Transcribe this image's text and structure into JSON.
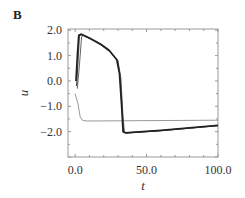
{
  "panel_label": "B",
  "chart_data": {
    "type": "line",
    "title": "",
    "xlabel": "t",
    "ylabel": "u",
    "xlim": [
      -5,
      100
    ],
    "ylim": [
      -3.0,
      2.05
    ],
    "grid": false,
    "legend": null,
    "x_ticks": [
      0,
      50,
      100
    ],
    "x_tick_labels": [
      "0.0",
      "50.0",
      "100.0"
    ],
    "y_ticks": [
      2,
      1,
      0,
      -1,
      -2
    ],
    "y_tick_labels": [
      "2.0",
      "1.0",
      "0.0",
      "−1.0",
      "−2.0"
    ],
    "series": [
      {
        "name": "trajectory-1",
        "color": "#222222",
        "width": 1.6,
        "points": [
          [
            0.5,
            0.0
          ],
          [
            1.5,
            1.0
          ],
          [
            2.5,
            1.8
          ],
          [
            4,
            1.85
          ],
          [
            10,
            1.7
          ],
          [
            18,
            1.45
          ],
          [
            24,
            1.2
          ],
          [
            29,
            0.85
          ],
          [
            31,
            0.3
          ],
          [
            32.5,
            -1.0
          ],
          [
            33.5,
            -2.0
          ],
          [
            35,
            -2.05
          ],
          [
            60,
            -1.95
          ],
          [
            100,
            -1.75
          ]
        ]
      },
      {
        "name": "trajectory-2",
        "color": "#444444",
        "width": 1.2,
        "points": [
          [
            1.0,
            -0.2
          ],
          [
            2.0,
            0.8
          ],
          [
            3.0,
            1.8
          ],
          [
            4.5,
            1.82
          ],
          [
            10,
            1.68
          ],
          [
            18,
            1.43
          ],
          [
            24,
            1.18
          ],
          [
            29.5,
            0.82
          ],
          [
            31.5,
            0.2
          ],
          [
            33,
            -1.2
          ],
          [
            34,
            -2.0
          ],
          [
            35.5,
            -2.05
          ],
          [
            60,
            -1.96
          ],
          [
            100,
            -1.76
          ]
        ]
      },
      {
        "name": "trajectory-3",
        "color": "#666666",
        "width": 1.0,
        "points": [
          [
            1.5,
            -0.3
          ],
          [
            3.0,
            0.6
          ],
          [
            4.5,
            1.75
          ],
          [
            6,
            1.8
          ],
          [
            11,
            1.67
          ],
          [
            18,
            1.42
          ],
          [
            24,
            1.17
          ],
          [
            30,
            0.8
          ],
          [
            32,
            0.1
          ],
          [
            33.5,
            -1.4
          ],
          [
            34.5,
            -2.0
          ],
          [
            36,
            -2.05
          ],
          [
            60,
            -1.96
          ],
          [
            100,
            -1.77
          ]
        ]
      },
      {
        "name": "trajectory-resting",
        "color": "#999999",
        "width": 1.0,
        "points": [
          [
            0,
            -0.5
          ],
          [
            2,
            -0.9
          ],
          [
            3.5,
            -1.4
          ],
          [
            5,
            -1.55
          ],
          [
            8,
            -1.58
          ],
          [
            30,
            -1.57
          ],
          [
            100,
            -1.55
          ]
        ]
      }
    ]
  }
}
